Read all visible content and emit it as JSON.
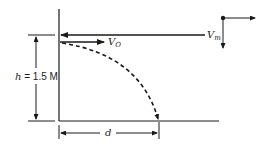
{
  "diagram": {
    "type": "projectile-trajectory",
    "colors": {
      "ink": "#1a1a1a",
      "background": "#ffffff"
    },
    "labels": {
      "v_m_main": "V",
      "v_m_sub": "m",
      "v_o_main": "V",
      "v_o_sub": "O",
      "height_var": "h",
      "height_eq": " = 1.5 M",
      "distance": "d"
    },
    "axes_icon": {
      "name": "coordinate-axes",
      "directions": [
        "right",
        "down"
      ]
    },
    "trajectory": {
      "style": "dashed",
      "description": "parabolic path from launch point to ground"
    }
  }
}
